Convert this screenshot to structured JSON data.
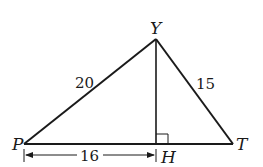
{
  "figure": {
    "type": "triangle",
    "vertices": {
      "P": {
        "label": "P",
        "x": 24,
        "y": 144
      },
      "Y": {
        "label": "Y",
        "x": 156,
        "y": 39
      },
      "T": {
        "label": "T",
        "x": 233,
        "y": 144
      },
      "H": {
        "label": "H",
        "x": 156,
        "y": 144
      }
    },
    "segments": [
      {
        "from": "P",
        "to": "Y",
        "length_label": "20"
      },
      {
        "from": "Y",
        "to": "T",
        "length_label": "15"
      },
      {
        "from": "P",
        "to": "T",
        "length_label": ""
      },
      {
        "from": "Y",
        "to": "H",
        "length_label": "",
        "note": "altitude"
      }
    ],
    "right_angle_at": "H",
    "dimension": {
      "from": "P",
      "to": "H",
      "label": "16"
    }
  },
  "labels": {
    "Y": "Y",
    "P": "P",
    "T": "T",
    "H": "H",
    "PY": "20",
    "YT": "15",
    "PH": "16"
  },
  "colors": {
    "stroke": "#1a1a1a",
    "background": "#ffffff"
  }
}
